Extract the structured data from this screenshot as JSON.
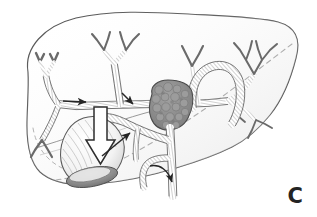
{
  "figure": {
    "panel_label": "C",
    "background_color": "#ffffff",
    "ink_color": "#3a3a3a",
    "outline_color": "#5a5a5a",
    "duct_shade_color": "#9a9a9a",
    "tumor_color": "#8c8c8c",
    "tumor_outline_color": "#4a4a4a",
    "arrow_outline_color": "#2e2e2e",
    "arrow_fill_color": "#ffffff",
    "dashed_line_color": "#a8a8a8",
    "shadow_color": "#707070"
  },
  "anatomy": {
    "liver_outline": "liver-silhouette",
    "posterior_margin": "dashed-posterior-border",
    "structures": [
      {
        "name": "left-hepatic-duct-branches",
        "side": "left"
      },
      {
        "name": "left-medial-duct-branches",
        "side": "left-center"
      },
      {
        "name": "right-hepatic-duct-branches",
        "side": "right"
      },
      {
        "name": "right-posterior-duct-branches",
        "side": "far-right"
      },
      {
        "name": "hilar-tumor-mass",
        "side": "center"
      },
      {
        "name": "common-hepatic-duct",
        "side": "center-inferior"
      },
      {
        "name": "common-bile-duct",
        "side": "center-inferior"
      },
      {
        "name": "cystic-duct",
        "side": "center-left-inferior"
      },
      {
        "name": "gallbladder",
        "side": "left-inferior"
      },
      {
        "name": "portal-vein-loop",
        "side": "right-center"
      }
    ]
  },
  "annotations": {
    "markers": [
      {
        "name": "block-arrow-gallbladder",
        "style": "hollow-outlined-down-arrow",
        "points_to": "gallbladder"
      },
      {
        "name": "thin-arrow-cystic-duct",
        "style": "solid-thin-up-right-arrow",
        "points_to": "cystic-duct"
      },
      {
        "name": "thin-arrow-left-duct",
        "style": "solid-thin-right-arrow",
        "points_to": "left-hepatic-duct"
      },
      {
        "name": "thin-arrow-medial-duct",
        "style": "solid-thin-down-right-arrow",
        "points_to": "left-medial-duct"
      },
      {
        "name": "curved-arrow-common-bile-duct",
        "style": "solid-curved-arrow",
        "points_to": "common-bile-duct"
      }
    ]
  }
}
